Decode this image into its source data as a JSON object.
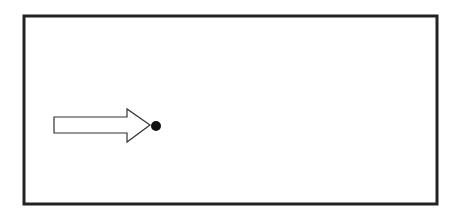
{
  "diagram": {
    "frame": {
      "x": 24,
      "y": 16,
      "width": 413,
      "height": 188,
      "stroke": "#222222",
      "stroke_width": 3
    },
    "arrow": {
      "direction": "right",
      "fill": "#ffffff",
      "stroke": "#333333",
      "points": "54,117 127,117 127,109 150,125 127,142 127,133 54,133"
    },
    "dot": {
      "cx": 156,
      "cy": 126,
      "r": 5,
      "fill": "#111111"
    }
  }
}
